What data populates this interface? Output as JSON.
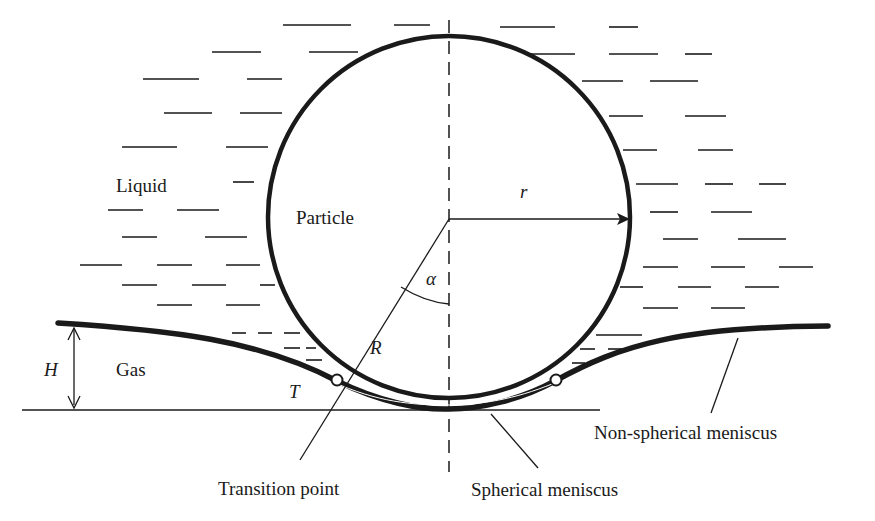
{
  "figure": {
    "colors": {
      "ink": "#1a1a1a",
      "background": "#ffffff"
    }
  },
  "labels": {
    "liquid": "Liquid",
    "particle": "Particle",
    "gas": "Gas",
    "radius_r": "r",
    "radius_R": "R",
    "angle": "α",
    "height": "H",
    "tension": "T",
    "transition_point": "Transition point",
    "spherical_meniscus": "Spherical meniscus",
    "non_spherical_meniscus": "Non-spherical meniscus"
  }
}
